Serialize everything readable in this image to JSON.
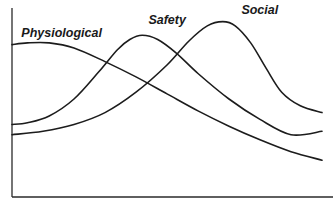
{
  "chart_data": {
    "type": "line",
    "title": "",
    "xlabel": "",
    "ylabel": "",
    "xlim": [
      0,
      100
    ],
    "ylim": [
      0,
      100
    ],
    "grid": false,
    "legend": "none",
    "x_ticks": [],
    "y_ticks": [],
    "series": [
      {
        "name": "Physiological",
        "label_anchor_x": 3,
        "points": [
          [
            0,
            82
          ],
          [
            5,
            83
          ],
          [
            12,
            83
          ],
          [
            20,
            80
          ],
          [
            30,
            72
          ],
          [
            40,
            63
          ],
          [
            50,
            53
          ],
          [
            60,
            43
          ],
          [
            70,
            34
          ],
          [
            80,
            26
          ],
          [
            90,
            19
          ],
          [
            100,
            14
          ]
        ]
      },
      {
        "name": "Safety",
        "label_anchor_x": 44,
        "points": [
          [
            0,
            35
          ],
          [
            5,
            36
          ],
          [
            12,
            40
          ],
          [
            20,
            50
          ],
          [
            28,
            66
          ],
          [
            34,
            79
          ],
          [
            38,
            85
          ],
          [
            42,
            87.5
          ],
          [
            47,
            85
          ],
          [
            53,
            77
          ],
          [
            60,
            65
          ],
          [
            70,
            50
          ],
          [
            80,
            38
          ],
          [
            90,
            29
          ],
          [
            100,
            31
          ]
        ]
      },
      {
        "name": "Social",
        "label_anchor_x": 74,
        "points": [
          [
            0,
            29
          ],
          [
            10,
            31
          ],
          [
            20,
            35
          ],
          [
            30,
            42
          ],
          [
            40,
            54
          ],
          [
            50,
            70
          ],
          [
            57,
            84
          ],
          [
            63,
            93
          ],
          [
            68,
            95.5
          ],
          [
            72,
            93
          ],
          [
            77,
            83
          ],
          [
            82,
            68
          ],
          [
            87,
            54
          ],
          [
            93,
            46
          ],
          [
            100,
            42
          ]
        ]
      }
    ]
  }
}
